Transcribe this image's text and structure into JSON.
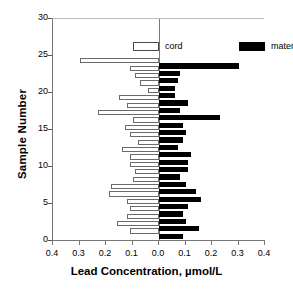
{
  "chart_data": {
    "type": "bar",
    "orientation": "horizontal-diverging",
    "title": "",
    "xlabel": "Lead Concentration, µmol/L",
    "ylabel": "Sample Number",
    "xlim": [
      -0.4,
      0.4
    ],
    "ylim": [
      0,
      30
    ],
    "xticks": [
      "0.4",
      "0.3",
      "0.2",
      "0.1",
      "0.0",
      "0.1",
      "0.2",
      "0.3",
      "0.4"
    ],
    "xtick_values": [
      -0.4,
      -0.3,
      -0.2,
      -0.1,
      0.0,
      0.1,
      0.2,
      0.3,
      0.4
    ],
    "yticks": [
      "30",
      "25",
      "20",
      "15",
      "10",
      "5",
      "0"
    ],
    "ytick_values": [
      30,
      25,
      20,
      15,
      10,
      5,
      0
    ],
    "grid": false,
    "legend_position": "top",
    "legend": [
      {
        "name": "cord",
        "fill": "#ffffff",
        "stroke": "#6a6a6a",
        "direction": "left"
      },
      {
        "name": "maternal",
        "fill": "#000000",
        "stroke": "#000000",
        "direction": "right"
      }
    ],
    "categories": [
      1,
      2,
      3,
      4,
      5,
      6,
      7,
      8,
      9,
      10,
      11,
      12,
      13,
      14,
      15,
      16,
      17,
      18,
      19,
      20,
      21,
      22,
      23,
      24
    ],
    "series": [
      {
        "name": "cord",
        "values": [
          0.11,
          0.16,
          0.12,
          0.11,
          0.12,
          0.19,
          0.18,
          0.1,
          0.09,
          0.11,
          0.11,
          0.14,
          0.08,
          0.11,
          0.13,
          0.1,
          0.23,
          0.12,
          0.15,
          0.04,
          0.07,
          0.09,
          0.11,
          0.3
        ]
      },
      {
        "name": "maternal",
        "values": [
          0.09,
          0.15,
          0.1,
          0.09,
          0.11,
          0.16,
          0.14,
          0.1,
          0.08,
          0.11,
          0.11,
          0.12,
          0.07,
          0.09,
          0.1,
          0.09,
          0.23,
          0.08,
          0.11,
          0.06,
          0.06,
          0.07,
          0.08,
          0.3
        ]
      }
    ],
    "axis_color": "#777777"
  },
  "legend_labels": {
    "cord": "cord",
    "maternal": "maternal"
  },
  "axes": {
    "xlabel": "Lead Concentration, µmol/L",
    "ylabel": "Sample Number"
  }
}
